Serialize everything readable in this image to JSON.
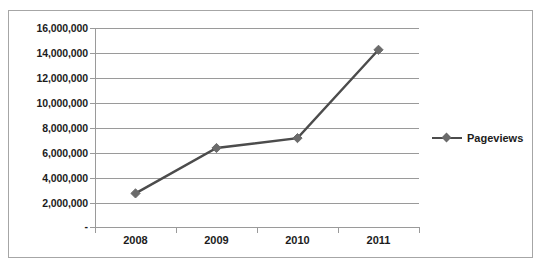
{
  "chart_data": {
    "type": "line",
    "title": "Pageviews",
    "xlabel": "",
    "ylabel": "",
    "categories": [
      "2008",
      "2009",
      "2010",
      "2011"
    ],
    "series": [
      {
        "name": "Pageviews",
        "values": [
          2700000,
          6350000,
          7150000,
          14250000
        ],
        "color": "#4c4c4c",
        "marker": "diamond",
        "marker_color": "#6b6b6b"
      }
    ],
    "ylim": [
      0,
      16000000
    ],
    "ytick_values": [
      0,
      2000000,
      4000000,
      6000000,
      8000000,
      10000000,
      12000000,
      14000000,
      16000000
    ],
    "ytick_labels": [
      "-",
      "2,000,000",
      "4,000,000",
      "6,000,000",
      "8,000,000",
      "10,000,000",
      "12,000,000",
      "14,000,000",
      "16,000,000"
    ],
    "grid": true,
    "grid_axis": "y",
    "legend": {
      "position": "right",
      "entries": [
        "Pageviews"
      ]
    },
    "plot_background": "#ffffff",
    "border_color": "#a6a6a6",
    "gridline_color": "#9a9a9a",
    "axis_color": "#9a9a9a",
    "text_color": "#1c1c1c"
  },
  "legend": {
    "label": "Pageviews"
  },
  "axis": {
    "y_labels": [
      {
        "text": "16,000,000",
        "top": 23
      },
      {
        "text": "14,000,000",
        "top": 48
      },
      {
        "text": "12,000,000",
        "top": 73
      },
      {
        "text": "10,000,000",
        "top": 98
      },
      {
        "text": "8,000,000",
        "top": 123
      },
      {
        "text": "6,000,000",
        "top": 148
      },
      {
        "text": "4,000,000",
        "top": 173
      },
      {
        "text": "2,000,000",
        "top": 198
      },
      {
        "text": "-",
        "top": 222
      }
    ],
    "x_labels": [
      "2008",
      "2009",
      "2010",
      "2011"
    ]
  }
}
